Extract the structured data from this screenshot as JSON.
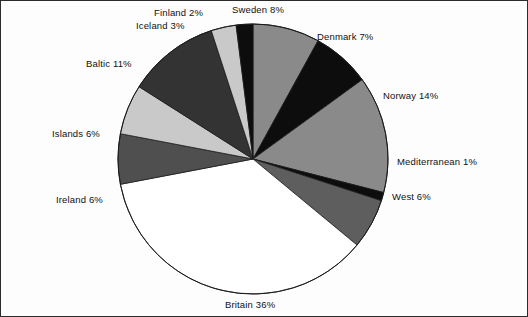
{
  "chart_data": {
    "type": "pie",
    "title": "",
    "xlabel": "",
    "ylabel": "",
    "unit": "%",
    "legend_position": "outside-labels",
    "grid": false,
    "start_angle_deg": 0,
    "direction": "clockwise",
    "categories": [
      "Sweden",
      "Denmark",
      "Norway",
      "Mediterranean",
      "West",
      "Britain",
      "Ireland",
      "Islands",
      "Baltic",
      "Iceland",
      "Finland"
    ],
    "values": [
      8,
      7,
      14,
      1,
      6,
      36,
      6,
      6,
      11,
      3,
      2
    ],
    "labels": [
      "Sweden 8%",
      "Denmark 7%",
      "Norway 14%",
      "Mediterranean 1%",
      "West 6%",
      "Britain 36%",
      "Ireland 6%",
      "Islands 6%",
      "Baltic 11%",
      "Iceland 3%",
      "Finland 2%"
    ],
    "slice_colors": [
      "#8a8a8a",
      "#0d0d0d",
      "#8a8a8a",
      "#0d0d0d",
      "#5e5e5e",
      "#ffffff",
      "#4f4f4f",
      "#c9c9c9",
      "#333333",
      "#c9c9c9",
      "#0d0d0d"
    ],
    "slices": [
      {
        "name": "Sweden",
        "value": 8,
        "label": "Sweden 8%",
        "color": "#8a8a8a"
      },
      {
        "name": "Denmark",
        "value": 7,
        "label": "Denmark 7%",
        "color": "#0d0d0d"
      },
      {
        "name": "Norway",
        "value": 14,
        "label": "Norway 14%",
        "color": "#8a8a8a"
      },
      {
        "name": "Mediterranean",
        "value": 1,
        "label": "Mediterranean 1%",
        "color": "#0d0d0d"
      },
      {
        "name": "West",
        "value": 6,
        "label": "West 6%",
        "color": "#5e5e5e"
      },
      {
        "name": "Britain",
        "value": 36,
        "label": "Britain 36%",
        "color": "#ffffff"
      },
      {
        "name": "Ireland",
        "value": 6,
        "label": "Ireland 6%",
        "color": "#4f4f4f"
      },
      {
        "name": "Islands",
        "value": 6,
        "label": "Islands 6%",
        "color": "#c9c9c9"
      },
      {
        "name": "Baltic",
        "value": 11,
        "label": "Baltic 11%",
        "color": "#333333"
      },
      {
        "name": "Iceland",
        "value": 3,
        "label": "Iceland 3%",
        "color": "#c9c9c9"
      },
      {
        "name": "Finland",
        "value": 2,
        "label": "Finland 2%",
        "color": "#0d0d0d"
      }
    ],
    "total": 100,
    "outline_color": "#1a1a1a",
    "background_color": "#fdfdfd"
  },
  "geometry": {
    "center_x": 253,
    "center_y": 159,
    "radius": 135
  },
  "label_positions": [
    {
      "name": "Sweden",
      "left": 232,
      "top": 4,
      "align": "left"
    },
    {
      "name": "Denmark",
      "left": 317,
      "top": 31,
      "align": "left"
    },
    {
      "name": "Norway",
      "left": 383,
      "top": 90,
      "align": "left"
    },
    {
      "name": "Mediterranean",
      "left": 397,
      "top": 156,
      "align": "left"
    },
    {
      "name": "West",
      "left": 392,
      "top": 191,
      "align": "left"
    },
    {
      "name": "Britain",
      "left": 225,
      "top": 299,
      "align": "left"
    },
    {
      "name": "Ireland",
      "left": 56,
      "top": 194,
      "align": "left"
    },
    {
      "name": "Islands",
      "left": 52,
      "top": 128,
      "align": "left"
    },
    {
      "name": "Baltic",
      "left": 86,
      "top": 58,
      "align": "left"
    },
    {
      "name": "Iceland",
      "left": 136,
      "top": 20,
      "align": "left"
    },
    {
      "name": "Finland",
      "left": 154,
      "top": 7,
      "align": "left"
    }
  ]
}
